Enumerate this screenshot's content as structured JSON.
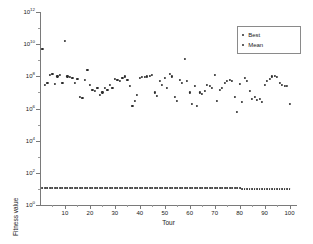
{
  "chart_data": {
    "type": "scatter",
    "title": "",
    "xlabel": "Tour",
    "ylabel": "Fitness value",
    "xlim": [
      0,
      103
    ],
    "ylim": [
      1,
      1000000000000.0
    ],
    "yscale": "log",
    "xticks": [
      10,
      20,
      30,
      40,
      50,
      60,
      70,
      80,
      90,
      100
    ],
    "xticklabels": [
      "10",
      "20",
      "30",
      "40",
      "50",
      "60",
      "70",
      "80",
      "90",
      "100"
    ],
    "yticks": [
      1,
      100,
      10000,
      1000000,
      100000000,
      10000000000,
      1000000000000
    ],
    "yticklabels": [
      "10",
      "10",
      "10",
      "10",
      "10",
      "10",
      "10"
    ],
    "yexponents": [
      "0",
      "2",
      "4",
      "6",
      "8",
      "10",
      "12"
    ],
    "grid": false,
    "legend_position": "upper right",
    "legend": [
      "Best",
      "Mean"
    ],
    "series": [
      {
        "name": "Mean",
        "marker": "dot",
        "x": [
          1,
          2,
          3,
          4,
          5,
          6,
          7,
          8,
          9,
          10,
          11,
          12,
          13,
          14,
          15,
          16,
          17,
          18,
          19,
          20,
          21,
          22,
          23,
          24,
          25,
          26,
          27,
          28,
          29,
          30,
          31,
          32,
          33,
          34,
          35,
          36,
          37,
          38,
          39,
          40,
          41,
          42,
          43,
          44,
          45,
          46,
          47,
          48,
          49,
          50,
          51,
          52,
          53,
          54,
          55,
          56,
          57,
          58,
          59,
          60,
          61,
          62,
          63,
          64,
          65,
          66,
          67,
          68,
          69,
          70,
          71,
          72,
          73,
          74,
          75,
          76,
          77,
          78,
          79,
          80,
          81,
          82,
          83,
          84,
          85,
          86,
          87,
          88,
          89,
          90,
          91,
          92,
          93,
          94,
          95,
          96,
          97,
          98,
          99,
          100
        ],
        "y": [
          5000000000.0,
          30000000.0,
          40000000.0,
          120000000.0,
          150000000.0,
          35000000.0,
          100000000.0,
          130000000.0,
          40000000.0,
          16000000000.0,
          100000000.0,
          90000000.0,
          80000000.0,
          40000000.0,
          70000000.0,
          5000000.0,
          4500000.0,
          60000000.0,
          250000000.0,
          30000000.0,
          15000000.0,
          13000000.0,
          20000000.0,
          7000000.0,
          10000000.0,
          20000000.0,
          15000000.0,
          30000000.0,
          20000000.0,
          70000000.0,
          60000000.0,
          50000000.0,
          80000000.0,
          100000000.0,
          60000000.0,
          25000000.0,
          1500000.0,
          3000000.0,
          7000000.0,
          80000000.0,
          90000000.0,
          90000000.0,
          100000000.0,
          110000000.0,
          120000000.0,
          10000000.0,
          6000000.0,
          50000000.0,
          30000000.0,
          80000000.0,
          20000000.0,
          150000000.0,
          100000000.0,
          5000000.0,
          3000000.0,
          60000000.0,
          40000000.0,
          1200000000.0,
          50000000.0,
          10000000.0,
          2000000.0,
          25000000.0,
          1500000.0,
          10000000.0,
          8000000.0,
          12000000.0,
          30000000.0,
          25000000.0,
          20000000.0,
          120000000.0,
          3000000.0,
          15000000.0,
          20000000.0,
          40000000.0,
          50000000.0,
          60000000.0,
          55000000.0,
          5000000.0,
          600000.0,
          35000000.0,
          2500000.0,
          80000000.0,
          50000000.0,
          12000000.0,
          4000000.0,
          5000000.0,
          3500000.0,
          4000000.0,
          2500000.0,
          30000000.0,
          50000000.0,
          70000000.0,
          100000000.0,
          110000000.0,
          90000000.0,
          40000000.0,
          30000000.0,
          25000000.0,
          25000000.0,
          2000000.0
        ]
      },
      {
        "name": "Best",
        "marker": "dot",
        "x": [
          1,
          2,
          3,
          4,
          5,
          6,
          7,
          8,
          9,
          10,
          11,
          12,
          13,
          14,
          15,
          16,
          17,
          18,
          19,
          20,
          21,
          22,
          23,
          24,
          25,
          26,
          27,
          28,
          29,
          30,
          31,
          32,
          33,
          34,
          35,
          36,
          37,
          38,
          39,
          40,
          41,
          42,
          43,
          44,
          45,
          46,
          47,
          48,
          49,
          50,
          51,
          52,
          53,
          54,
          55,
          56,
          57,
          58,
          59,
          60,
          61,
          62,
          63,
          64,
          65,
          66,
          67,
          68,
          69,
          70,
          71,
          72,
          73,
          74,
          75,
          76,
          77,
          78,
          79,
          80,
          81,
          82,
          83,
          84,
          85,
          86,
          87,
          88,
          89,
          90,
          91,
          92,
          93,
          94,
          95,
          96,
          97,
          98,
          99,
          100
        ],
        "y": [
          11,
          11,
          11,
          11,
          11,
          11,
          11,
          11,
          11,
          11,
          11,
          11,
          11,
          11,
          11,
          11,
          11,
          11,
          11,
          11,
          11,
          11,
          11,
          11,
          11,
          11,
          11,
          11,
          11,
          11,
          11,
          11,
          11,
          11,
          11,
          11,
          11,
          11,
          11,
          11,
          11,
          11,
          11,
          11,
          11,
          11,
          11,
          11,
          11,
          11,
          11,
          11,
          11,
          11,
          11,
          11,
          11,
          11,
          11,
          11,
          11,
          11,
          11,
          11,
          11,
          11,
          11,
          11,
          11,
          11,
          11,
          11,
          11,
          11,
          11,
          11,
          11,
          11,
          11,
          11,
          10,
          10,
          10,
          10,
          10,
          10,
          10,
          10,
          10,
          10,
          10,
          10,
          10,
          10,
          10,
          10,
          10,
          10,
          10,
          10
        ]
      }
    ],
    "marker_color": "#2b2b2b",
    "axis_color": "#7a7a7a"
  }
}
